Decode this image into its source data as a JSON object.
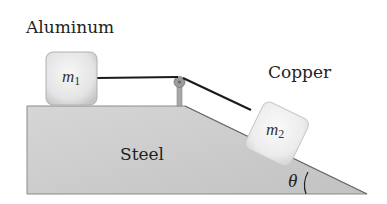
{
  "labels": {
    "aluminum": "Aluminum",
    "copper": "Copper",
    "steel": "Steel",
    "theta": "θ"
  },
  "masses": {
    "m1": {
      "symbol": "m",
      "subscript": "1",
      "material": "Aluminum"
    },
    "m2": {
      "symbol": "m",
      "subscript": "2",
      "material": "Copper"
    }
  },
  "colors": {
    "steel_fill": "#c9c9c9",
    "steel_edge": "#7a7a7a",
    "block_fill": "#e6e6e6",
    "block_edge": "#b5b5b5",
    "string": "#1a1a1a",
    "pulley": "#9a9a9a",
    "text": "#222222"
  }
}
